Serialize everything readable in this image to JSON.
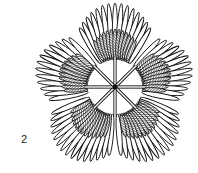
{
  "figure": {
    "label": "2",
    "center": [
      115,
      87
    ],
    "lobes": [
      {
        "angle": -90,
        "span": 62,
        "outer": 84,
        "inner": 30,
        "petals": 15
      },
      {
        "angle": -18,
        "span": 58,
        "outer": 80,
        "inner": 30,
        "petals": 13
      },
      {
        "angle": 54,
        "span": 62,
        "outer": 84,
        "inner": 30,
        "petals": 15
      },
      {
        "angle": 126,
        "span": 62,
        "outer": 84,
        "inner": 30,
        "petals": 15
      },
      {
        "angle": 198,
        "span": 58,
        "outer": 82,
        "inner": 30,
        "petals": 13
      }
    ],
    "spokes": 8,
    "spoke_length": 30,
    "colors": {
      "stroke": "#111111",
      "fill": "#ffffff",
      "hatch": "#333333"
    }
  }
}
